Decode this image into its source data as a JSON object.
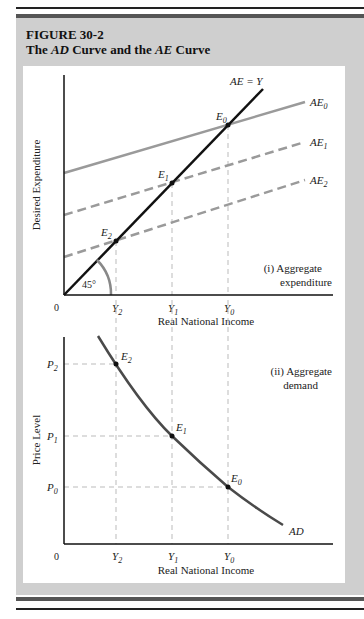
{
  "figure": {
    "number": "FIGURE 30-2",
    "title_parts": [
      "The ",
      "AD",
      " Curve and the ",
      "AE",
      " Curve"
    ]
  },
  "panel_i": {
    "label_line1": "(i) Aggregate",
    "label_line2": "expenditure",
    "ylabel": "Desired Expenditure",
    "xlabel": "Real National Income",
    "origin": "0",
    "angle_label": "45°",
    "line_45_label": "AE = Y",
    "curves": [
      "AE0",
      "AE1",
      "AE2"
    ],
    "points": [
      "E0",
      "E1",
      "E2"
    ],
    "x_ticks": [
      "Y2",
      "Y1",
      "Y0"
    ]
  },
  "panel_ii": {
    "label_line1": "(ii) Aggregate",
    "label_line2": "demand",
    "ylabel": "Price Level",
    "xlabel": "Real National Income",
    "origin": "0",
    "curve": "AD",
    "points": [
      "E2",
      "E1",
      "E0"
    ],
    "x_ticks": [
      "Y2",
      "Y1",
      "Y0"
    ],
    "y_ticks": [
      "P2",
      "P1",
      "P0"
    ]
  },
  "colors": {
    "frame": "#cfcfcf",
    "band": "#555555",
    "line_45": "#111111",
    "ae_curves": "#9a9a9a",
    "ad_curve": "#4a4a4a",
    "guides": "#bbbbbb"
  }
}
